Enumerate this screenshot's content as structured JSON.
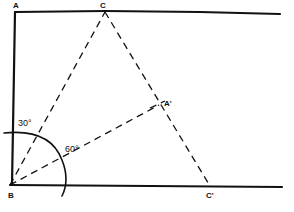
{
  "diagram": {
    "labels": {
      "A": "A",
      "B": "B",
      "C": "C",
      "A_prime": "A'",
      "C_prime": "C'",
      "angle_30": "30°",
      "angle_60": "60°"
    },
    "stroke_color": "#111111"
  }
}
